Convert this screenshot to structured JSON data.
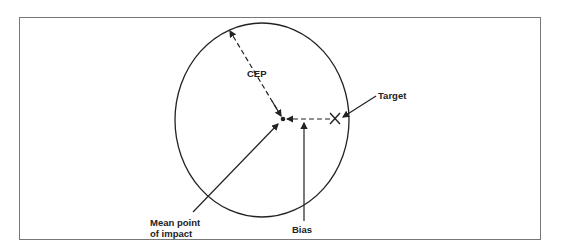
{
  "figure": {
    "labels": {
      "cep": "CEP",
      "target": "Target",
      "mean_point_line1": "Mean point",
      "mean_point_line2": "of impact",
      "bias": "Bias"
    },
    "symbols": {
      "target_marker": "×"
    },
    "colors": {
      "line": "#222222",
      "frame": "#777777",
      "background": "#ffffff"
    }
  }
}
